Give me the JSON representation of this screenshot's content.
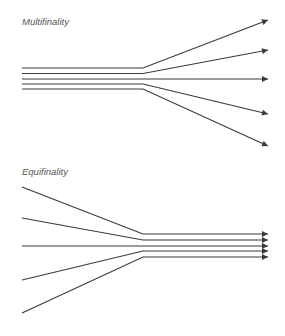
{
  "panels": [
    {
      "title": "Multifinality",
      "kind": "diverging",
      "title_pos": [
        22,
        16
      ],
      "paths": [
        [
          [
            22,
            68
          ],
          [
            143,
            68
          ],
          [
            268,
            20
          ]
        ],
        [
          [
            22,
            73.5
          ],
          [
            143,
            73.5
          ],
          [
            268,
            50
          ]
        ],
        [
          [
            22,
            79
          ],
          [
            143,
            79
          ],
          [
            268,
            79
          ]
        ],
        [
          [
            22,
            84
          ],
          [
            143,
            84
          ],
          [
            268,
            114
          ]
        ],
        [
          [
            22,
            89
          ],
          [
            143,
            89
          ],
          [
            268,
            146
          ]
        ]
      ]
    },
    {
      "title": "Equifinality",
      "kind": "converging",
      "title_pos": [
        22,
        166
      ],
      "paths": [
        [
          [
            22,
            187
          ],
          [
            143,
            234
          ],
          [
            268,
            234
          ]
        ],
        [
          [
            22,
            218
          ],
          [
            143,
            240
          ],
          [
            268,
            240
          ]
        ],
        [
          [
            22,
            246
          ],
          [
            143,
            246
          ],
          [
            268,
            246
          ]
        ],
        [
          [
            22,
            280
          ],
          [
            143,
            251
          ],
          [
            268,
            251
          ]
        ],
        [
          [
            22,
            313
          ],
          [
            143,
            257
          ],
          [
            268,
            257
          ]
        ]
      ]
    }
  ],
  "style": {
    "line_color": "#3a3a3a",
    "label_color": "#555555"
  }
}
